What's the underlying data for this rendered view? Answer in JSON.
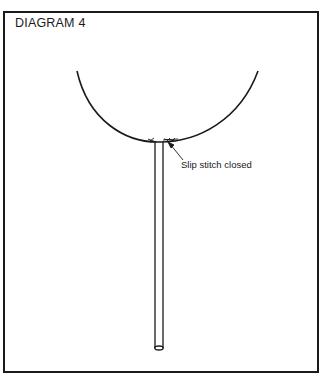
{
  "diagram": {
    "title": "DIAGRAM 4",
    "annotations": [
      {
        "label": "Slip stitch closed",
        "points_to": "seam at base of balloon"
      }
    ],
    "elements": [
      "balloon (half-circle outline)",
      "stick/dowel",
      "stitched seam"
    ],
    "colors": {
      "line": "#1a1a1a",
      "background": "#ffffff"
    }
  }
}
